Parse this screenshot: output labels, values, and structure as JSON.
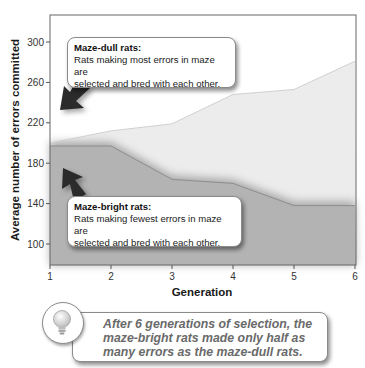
{
  "chart_data": {
    "type": "area",
    "title": "",
    "xlabel": "Generation",
    "ylabel": "Average number of errors committed",
    "x": [
      1,
      2,
      3,
      4,
      5,
      6
    ],
    "x_ticks": [
      "1",
      "2",
      "3",
      "4",
      "5",
      "6"
    ],
    "y_ticks": [
      "100",
      "140",
      "180",
      "220",
      "260",
      "300"
    ],
    "xlim": [
      1,
      6
    ],
    "ylim": [
      79,
      328
    ],
    "grid": false,
    "series": [
      {
        "name": "Maze-dull rats",
        "values": [
          200,
          212,
          219,
          248,
          253,
          281
        ],
        "color": "#ececec"
      },
      {
        "name": "Maze-bright rats",
        "values": [
          197,
          197,
          164,
          160,
          138,
          138
        ],
        "color": "#b3b3b3"
      }
    ],
    "annotations": [
      {
        "title": "Maze-dull rats:",
        "text_lines": [
          "Rats making most errors in maze are",
          "selected and bred with each other."
        ]
      },
      {
        "title": "Maze-bright rats:",
        "text_lines": [
          "Rats making fewest errors in maze are",
          "selected and bred with each other."
        ]
      }
    ],
    "conclusion_lines": [
      "After 6 generations of selection, the",
      "maze-bright rats made only half as",
      "many errors as the maze-dull rats."
    ]
  },
  "icons": {
    "conclusion_badge": "lightbulb-icon",
    "dull_arrow": "arrow-down-left-icon",
    "bright_arrow": "arrow-up-left-icon"
  },
  "colors": {
    "dull_fill": "#ececec",
    "bright_fill": "#b3b3b3",
    "arrow": "#2b2b2b",
    "axis": "#555555"
  }
}
